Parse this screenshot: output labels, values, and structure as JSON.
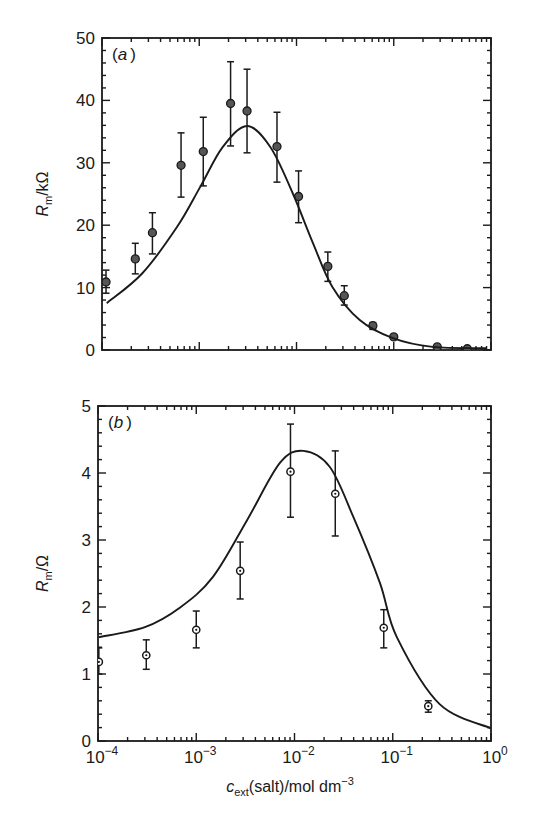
{
  "figure": {
    "xlabel_main": "c",
    "xlabel_sub": "ext",
    "xlabel_rest": "(salt)/mol dm",
    "xlabel_sup": "−3"
  },
  "chart_data": [
    {
      "type": "scatter",
      "panel": "(a)",
      "panel_letter": "a",
      "title": "",
      "xlabel": "c_ext(salt)/mol dm^-3",
      "ylabel": "R_m/kΩ",
      "ylabel_main": "R",
      "ylabel_sub": "m",
      "ylabel_rest": "/kΩ",
      "xscale": "log",
      "xlim": [
        0.0001,
        1
      ],
      "ylim": [
        0,
        50
      ],
      "yticks": [
        0,
        10,
        20,
        30,
        40,
        50
      ],
      "ytick_labels": [
        "0",
        "10",
        "20",
        "30",
        "40",
        "50"
      ],
      "xtick_labels_shown": false,
      "grid": false,
      "frame_px": {
        "left": 102,
        "top": 38,
        "right": 491,
        "bottom": 350
      },
      "series": [
        {
          "name": "measured",
          "style": "points-with-errorbars",
          "points": [
            {
              "x": 0.00011,
              "y": 10.9,
              "lo": 9.1,
              "hi": 12.8
            },
            {
              "x": 0.00022,
              "y": 14.6,
              "lo": 12.2,
              "hi": 17.1
            },
            {
              "x": 0.00033,
              "y": 18.8,
              "lo": 15.4,
              "hi": 22.0
            },
            {
              "x": 0.00065,
              "y": 29.6,
              "lo": 24.5,
              "hi": 34.8
            },
            {
              "x": 0.0011,
              "y": 31.8,
              "lo": 26.3,
              "hi": 37.3
            },
            {
              "x": 0.0021,
              "y": 39.5,
              "lo": 32.7,
              "hi": 46.2
            },
            {
              "x": 0.0031,
              "y": 38.3,
              "lo": 31.6,
              "hi": 45.0
            },
            {
              "x": 0.0063,
              "y": 32.6,
              "lo": 26.9,
              "hi": 38.1
            },
            {
              "x": 0.0105,
              "y": 24.6,
              "lo": 20.4,
              "hi": 28.7
            },
            {
              "x": 0.021,
              "y": 13.4,
              "lo": 11.0,
              "hi": 15.7
            },
            {
              "x": 0.031,
              "y": 8.7,
              "lo": 7.2,
              "hi": 10.3
            },
            {
              "x": 0.061,
              "y": 3.9,
              "lo": 3.3,
              "hi": 4.4
            },
            {
              "x": 0.1,
              "y": 2.1,
              "lo": 1.8,
              "hi": 2.4
            },
            {
              "x": 0.28,
              "y": 0.5,
              "lo": 0.3,
              "hi": 0.7
            },
            {
              "x": 0.57,
              "y": 0.2,
              "lo": 0.1,
              "hi": 0.3
            }
          ]
        },
        {
          "name": "fit",
          "style": "line",
          "points": [
            {
              "x": 0.000112,
              "y": 7.5
            },
            {
              "x": 0.00026,
              "y": 12.3
            },
            {
              "x": 0.00059,
              "y": 19.7
            },
            {
              "x": 0.00102,
              "y": 26.1
            },
            {
              "x": 0.00174,
              "y": 32.5
            },
            {
              "x": 0.0031,
              "y": 35.9
            },
            {
              "x": 0.0054,
              "y": 32.5
            },
            {
              "x": 0.0091,
              "y": 25.2
            },
            {
              "x": 0.0148,
              "y": 17.1
            },
            {
              "x": 0.0234,
              "y": 10.1
            },
            {
              "x": 0.0447,
              "y": 4.8
            },
            {
              "x": 0.098,
              "y": 1.9
            },
            {
              "x": 0.25,
              "y": 0.5
            },
            {
              "x": 0.91,
              "y": 0.3
            }
          ]
        }
      ]
    },
    {
      "type": "scatter",
      "panel": "(b)",
      "panel_letter": "b",
      "title": "",
      "xlabel": "c_ext(salt)/mol dm^-3",
      "ylabel": "R_m/Ω",
      "ylabel_main": "R",
      "ylabel_sub": "m",
      "ylabel_rest": "/Ω",
      "xscale": "log",
      "xlim": [
        0.0001,
        1
      ],
      "ylim": [
        0,
        5
      ],
      "yticks": [
        0,
        1,
        2,
        3,
        4,
        5
      ],
      "ytick_labels": [
        "0",
        "1",
        "2",
        "3",
        "4",
        "5"
      ],
      "xticks": [
        0.0001,
        0.001,
        0.01,
        0.1,
        1
      ],
      "xtick_labels": [
        {
          "base": "10",
          "exp": "−4"
        },
        {
          "base": "10",
          "exp": "−3"
        },
        {
          "base": "10",
          "exp": "−2"
        },
        {
          "base": "10",
          "exp": "−1"
        },
        {
          "base": "10",
          "exp": "0"
        }
      ],
      "xtick_labels_shown": true,
      "grid": false,
      "frame_px": {
        "left": 98,
        "top": 406,
        "right": 491,
        "bottom": 741
      },
      "series": [
        {
          "name": "measured",
          "style": "open-points-with-errorbars",
          "points": [
            {
              "x": 0.000102,
              "y": 1.18,
              "lo": 1.0,
              "hi": 1.39
            },
            {
              "x": 0.00031,
              "y": 1.28,
              "lo": 1.07,
              "hi": 1.51
            },
            {
              "x": 0.001,
              "y": 1.66,
              "lo": 1.39,
              "hi": 1.94
            },
            {
              "x": 0.0028,
              "y": 2.54,
              "lo": 2.12,
              "hi": 2.97
            },
            {
              "x": 0.0091,
              "y": 4.02,
              "lo": 3.34,
              "hi": 4.73
            },
            {
              "x": 0.026,
              "y": 3.69,
              "lo": 3.06,
              "hi": 4.33
            },
            {
              "x": 0.081,
              "y": 1.69,
              "lo": 1.39,
              "hi": 1.96
            },
            {
              "x": 0.23,
              "y": 0.52,
              "lo": 0.43,
              "hi": 0.6
            }
          ]
        },
        {
          "name": "fit",
          "style": "line",
          "points": [
            {
              "x": 0.000102,
              "y": 1.55
            },
            {
              "x": 0.0003,
              "y": 1.7
            },
            {
              "x": 0.00068,
              "y": 1.99
            },
            {
              "x": 0.00148,
              "y": 2.45
            },
            {
              "x": 0.0033,
              "y": 3.3
            },
            {
              "x": 0.0071,
              "y": 4.15
            },
            {
              "x": 0.0123,
              "y": 4.33
            },
            {
              "x": 0.0229,
              "y": 4.09
            },
            {
              "x": 0.0398,
              "y": 3.34
            },
            {
              "x": 0.074,
              "y": 2.36
            },
            {
              "x": 0.11,
              "y": 1.55
            },
            {
              "x": 0.3,
              "y": 0.55
            },
            {
              "x": 1.0,
              "y": 0.19
            }
          ]
        }
      ]
    }
  ]
}
